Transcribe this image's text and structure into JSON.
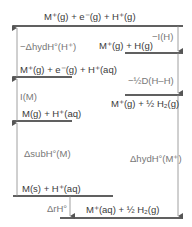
{
  "levels": {
    "top": "M⁺(g) + e⁻(g) + H⁺(g)",
    "right_2": "M⁺(g) + H(g)",
    "left_2": "M⁺(g) + e⁻(g) + H⁺(aq)",
    "right_3": "M⁺(g) + ½ H₂(g)",
    "left_3": "M(g) + H⁺(aq)",
    "left_4": "M(s) + H⁺(aq)",
    "bottom": "M⁺(aq) + ½ H₂(g)"
  },
  "steps": {
    "neg_hyd_H": "−ΔhydH°(H⁺)",
    "neg_ionization_H": "−I(H)",
    "half_dissociation": "−½D(H–H)",
    "ionization_M": "I(M)",
    "sublimation_M": "ΔsubH°(M)",
    "hydration_M": "ΔhydH°(M⁺)",
    "reaction": "ΔrH°"
  },
  "colors": {
    "line": "#2b2b2b",
    "arrow": "#777777",
    "text": "#3a3a3a",
    "step_text": "#777777"
  }
}
